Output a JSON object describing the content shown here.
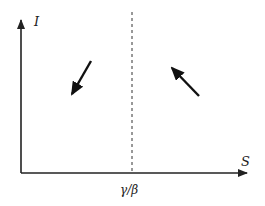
{
  "diagram": {
    "type": "phase-plane",
    "y_axis_label": "I",
    "x_axis_label": "S",
    "threshold_label": "γ/β",
    "arrows": [
      {
        "region": "left of threshold",
        "direction": "down-left"
      },
      {
        "region": "right of threshold",
        "direction": "up-left"
      }
    ],
    "colors": {
      "axis": "#222222",
      "arrow": "#111111",
      "dashed": "#333333"
    }
  }
}
